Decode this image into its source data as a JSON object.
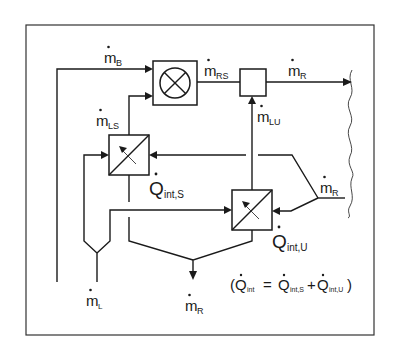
{
  "diagram": {
    "type": "mass-flow schematic with heat exchangers",
    "labels": {
      "m_B": {
        "base": "m",
        "sub": "B"
      },
      "m_RS": {
        "base": "m",
        "sub": "RS"
      },
      "m_R_top": {
        "base": "m",
        "sub": "R"
      },
      "m_LS": {
        "base": "m",
        "sub": "LS"
      },
      "m_LU": {
        "base": "m",
        "sub": "LU"
      },
      "m_R_right": {
        "base": "m",
        "sub": "R"
      },
      "Q_int_S": {
        "base": "Q",
        "sub": "int,S"
      },
      "Q_int_U": {
        "base": "Q",
        "sub": "int,U"
      },
      "m_L": {
        "base": "m",
        "sub": "L"
      },
      "m_R_bottom": {
        "base": "m",
        "sub": "R"
      }
    },
    "equation": {
      "open": "(",
      "lhs_base": "Q",
      "lhs_sub": "int",
      "equals": "=",
      "t1_base": "Q",
      "t1_sub": "int,S",
      "plus": "+",
      "t2_base": "Q",
      "t2_sub": "int,U",
      "close": ")"
    },
    "components": [
      {
        "id": "mixer",
        "symbol": "circle-cross"
      },
      {
        "id": "junction",
        "symbol": "square"
      },
      {
        "id": "hx-s",
        "symbol": "heat-exchanger"
      },
      {
        "id": "hx-u",
        "symbol": "heat-exchanger"
      }
    ],
    "colors": {
      "ink": "#1a1a1a",
      "background": "#ffffff"
    }
  }
}
